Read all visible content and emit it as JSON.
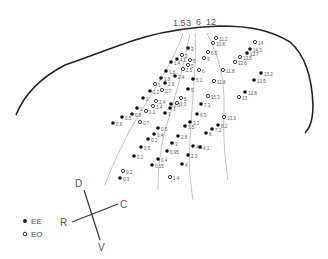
{
  "diagram": {
    "outline_path": "M16,115 C24,95 40,78 65,65 C95,55 120,44 145,37 C170,30 195,27 220,26 C250,26 270,30 290,42 C305,55 312,78 313,105 C313,120 310,128 305,133",
    "isochrone_labels": [
      {
        "text": "1.5",
        "x": 173,
        "y": 26
      },
      {
        "text": "3",
        "x": 186,
        "y": 26
      },
      {
        "text": "6",
        "x": 196,
        "y": 25
      },
      {
        "text": "12",
        "x": 206,
        "y": 25
      }
    ],
    "isochrones": [
      "M183,33 C175,60 150,95 130,130 C120,150 110,170 105,185",
      "M190,33 C185,60 175,100 165,130 C160,150 158,170 158,190",
      "M195,33 C197,60 192,100 190,140 C188,160 190,180 193,200",
      "M207,33 C215,50 225,70 224,110 C223,140 225,160 228,180"
    ],
    "points": [
      {
        "v": "11.2",
        "x": 216,
        "y": 38,
        "t": "EO"
      },
      {
        "v": "10.8",
        "x": 213,
        "y": 43,
        "t": "EO"
      },
      {
        "v": "14",
        "x": 255,
        "y": 42,
        "t": "EO"
      },
      {
        "v": "14.3",
        "x": 250,
        "y": 49,
        "t": "EE"
      },
      {
        "v": "13.7",
        "x": 247,
        "y": 53,
        "t": "EE"
      },
      {
        "v": "13.5",
        "x": 240,
        "y": 57,
        "t": "EO"
      },
      {
        "v": "12.6",
        "x": 235,
        "y": 62,
        "t": "EO"
      },
      {
        "v": "3",
        "x": 188,
        "y": 48,
        "t": "EE"
      },
      {
        "v": "6.5",
        "x": 208,
        "y": 52,
        "t": "EO"
      },
      {
        "v": "9",
        "x": 204,
        "y": 58,
        "t": "EO"
      },
      {
        "v": "4.2",
        "x": 177,
        "y": 59,
        "t": "EE"
      },
      {
        "v": "3",
        "x": 182,
        "y": 55,
        "t": "EO"
      },
      {
        "v": "1.4",
        "x": 171,
        "y": 62,
        "t": "EE"
      },
      {
        "v": "5",
        "x": 190,
        "y": 60,
        "t": "EO"
      },
      {
        "v": "5",
        "x": 188,
        "y": 65,
        "t": "EO"
      },
      {
        "v": "1.6",
        "x": 166,
        "y": 71,
        "t": "EE"
      },
      {
        "v": "2.5",
        "x": 183,
        "y": 69,
        "t": "EO"
      },
      {
        "v": "6",
        "x": 199,
        "y": 70,
        "t": "EO"
      },
      {
        "v": "11.8",
        "x": 223,
        "y": 70,
        "t": "EO"
      },
      {
        "v": "15.2",
        "x": 261,
        "y": 73,
        "t": "EE"
      },
      {
        "v": "1.8",
        "x": 161,
        "y": 78,
        "t": "EE"
      },
      {
        "v": "2.4",
        "x": 175,
        "y": 76,
        "t": "EE"
      },
      {
        "v": "5.1",
        "x": 193,
        "y": 79,
        "t": "EE"
      },
      {
        "v": "11.8",
        "x": 214,
        "y": 81,
        "t": "EO"
      },
      {
        "v": "13.5",
        "x": 254,
        "y": 80,
        "t": "EE"
      },
      {
        "v": "1",
        "x": 155,
        "y": 84,
        "t": "EO"
      },
      {
        "v": "2.6",
        "x": 165,
        "y": 83,
        "t": "EE"
      },
      {
        "v": "1.2",
        "x": 150,
        "y": 91,
        "t": "EE"
      },
      {
        "v": "2.7",
        "x": 162,
        "y": 90,
        "t": "EO"
      },
      {
        "v": "5",
        "x": 188,
        "y": 89,
        "t": "EE"
      },
      {
        "v": "10.3",
        "x": 208,
        "y": 96,
        "t": "EO"
      },
      {
        "v": "12.8",
        "x": 245,
        "y": 92,
        "t": "EE"
      },
      {
        "v": "13",
        "x": 239,
        "y": 97,
        "t": "EO"
      },
      {
        "v": "1",
        "x": 143,
        "y": 98,
        "t": "EE"
      },
      {
        "v": "2.4",
        "x": 156,
        "y": 101,
        "t": "EO"
      },
      {
        "v": "5",
        "x": 181,
        "y": 98,
        "t": "EO"
      },
      {
        "v": "1",
        "x": 137,
        "y": 108,
        "t": "EE"
      },
      {
        "v": "1.4",
        "x": 153,
        "y": 106,
        "t": "EO"
      },
      {
        "v": "2.3",
        "x": 171,
        "y": 104,
        "t": "EE"
      },
      {
        "v": "3.3",
        "x": 177,
        "y": 103,
        "t": "EO"
      },
      {
        "v": "7.3",
        "x": 201,
        "y": 104,
        "t": "EE"
      },
      {
        "v": "1.1",
        "x": 146,
        "y": 111,
        "t": "EO"
      },
      {
        "v": "1",
        "x": 165,
        "y": 113,
        "t": "EE"
      },
      {
        "v": "1",
        "x": 170,
        "y": 108,
        "t": "EE"
      },
      {
        "v": "6.3",
        "x": 197,
        "y": 114,
        "t": "EE"
      },
      {
        "v": "13.3",
        "x": 224,
        "y": 117,
        "t": "EO"
      },
      {
        "v": "0.8",
        "x": 132,
        "y": 114,
        "t": "EE"
      },
      {
        "v": "0.5",
        "x": 122,
        "y": 117,
        "t": "EE"
      },
      {
        "v": "0.6",
        "x": 113,
        "y": 123,
        "t": "EE"
      },
      {
        "v": "0.7",
        "x": 140,
        "y": 122,
        "t": "EO"
      },
      {
        "v": "3.1",
        "x": 190,
        "y": 122,
        "t": "EE"
      },
      {
        "v": "3.5",
        "x": 185,
        "y": 126,
        "t": "EE"
      },
      {
        "v": "8.2",
        "x": 218,
        "y": 125,
        "t": "EE"
      },
      {
        "v": "7.2",
        "x": 212,
        "y": 129,
        "t": "EE"
      },
      {
        "v": "6",
        "x": 206,
        "y": 133,
        "t": "EE"
      },
      {
        "v": "0.5",
        "x": 158,
        "y": 128,
        "t": "EE"
      },
      {
        "v": "0.4",
        "x": 154,
        "y": 134,
        "t": "EE"
      },
      {
        "v": "2.8",
        "x": 178,
        "y": 136,
        "t": "EE"
      },
      {
        "v": "0.3",
        "x": 148,
        "y": 139,
        "t": "EE"
      },
      {
        "v": "3",
        "x": 172,
        "y": 143,
        "t": "EE"
      },
      {
        "v": "4.3",
        "x": 193,
        "y": 146,
        "t": "EE"
      },
      {
        "v": "0.5",
        "x": 141,
        "y": 147,
        "t": "EE"
      },
      {
        "v": "0.95",
        "x": 167,
        "y": 151,
        "t": "EE"
      },
      {
        "v": "4.1",
        "x": 200,
        "y": 147,
        "t": "EE"
      },
      {
        "v": "2.3",
        "x": 188,
        "y": 155,
        "t": "EE"
      },
      {
        "v": "0.2",
        "x": 134,
        "y": 156,
        "t": "EE"
      },
      {
        "v": "0.4",
        "x": 158,
        "y": 159,
        "t": "EE"
      },
      {
        "v": "4",
        "x": 182,
        "y": 164,
        "t": "EE"
      },
      {
        "v": "0.15",
        "x": 152,
        "y": 165,
        "t": "EE"
      },
      {
        "v": "0.2",
        "x": 123,
        "y": 171,
        "t": "EO"
      },
      {
        "v": "0.3",
        "x": 120,
        "y": 178,
        "t": "EE"
      },
      {
        "v": "1.4",
        "x": 170,
        "y": 177,
        "t": "EO"
      }
    ],
    "compass": {
      "labels": [
        {
          "text": "D",
          "x": 75,
          "y": 187
        },
        {
          "text": "C",
          "x": 120,
          "y": 208
        },
        {
          "text": "R",
          "x": 60,
          "y": 226
        },
        {
          "text": "V",
          "x": 98,
          "y": 251
        }
      ]
    },
    "legend": [
      {
        "symbol": "filled",
        "label": "EE"
      },
      {
        "symbol": "open",
        "label": "EO"
      }
    ]
  }
}
